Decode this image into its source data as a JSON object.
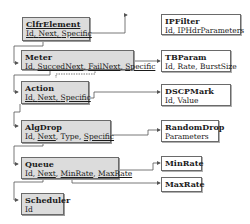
{
  "diagram": {
    "elements": [
      {
        "id": "clfrelement",
        "title": "ClfrElement",
        "fields": [
          "Id",
          "Next",
          "Specific"
        ],
        "underlined": [
          "Id",
          "Next",
          "Specific"
        ],
        "title_underlined": true
      },
      {
        "id": "meter",
        "title": "Meter",
        "fields": [
          "Id",
          "SuccedNext",
          "FailNext",
          "Specific"
        ],
        "underlined": [
          "SuccedNext",
          "FailNext",
          "Specific"
        ]
      },
      {
        "id": "action",
        "title": "Action",
        "fields": [
          "Id",
          "Next",
          "Specific"
        ],
        "underlined": [
          "Id",
          "Next",
          "Specific"
        ]
      },
      {
        "id": "algdrop",
        "title": "AlgDrop",
        "fields": [
          "Id",
          "Next",
          "Type",
          "Specific"
        ],
        "underlined": [
          "Next",
          "Specific"
        ]
      },
      {
        "id": "queue",
        "title": "Queue",
        "fields": [
          "Id",
          "Next",
          "MinRate",
          "MaxRate"
        ],
        "underlined": [
          "Next",
          "MinRate",
          "MaxRate"
        ]
      },
      {
        "id": "scheduler",
        "title": "Scheduler",
        "fields": [
          "Id"
        ],
        "underlined": []
      }
    ],
    "parameters": [
      {
        "id": "ipfilter",
        "title": "IPFilter",
        "fields_text": "Id, IPHdrParameters"
      },
      {
        "id": "tbparam",
        "title": "TBParam",
        "fields_text": "Id, Rate, BurstSize"
      },
      {
        "id": "dscpmark",
        "title": "DSCPMark",
        "fields_text": "Id, Value"
      },
      {
        "id": "randomdrop",
        "title": "RandomDrop",
        "fields_text": "Parameters"
      },
      {
        "id": "minrate",
        "title": "MinRate",
        "fields_text": ""
      },
      {
        "id": "maxrate",
        "title": "MaxRate",
        "fields_text": ""
      }
    ],
    "labels": {
      "clfr_title": "ClfrElement",
      "clfr_f1": "Id",
      "clfr_f2": "Next",
      "clfr_f3": "Specific",
      "meter_title": "Meter",
      "meter_f1": "Id",
      "meter_f2": "SuccedNext",
      "meter_f3": "FailNext",
      "meter_f4": "Specific",
      "action_title": "Action",
      "action_f1": "Id",
      "action_f2": "Next",
      "action_f3": "Specific",
      "algdrop_title": "AlgDrop",
      "algdrop_f1": "Id",
      "algdrop_f2": "Next",
      "algdrop_f3": "Type",
      "algdrop_f4": "Specific",
      "queue_title": "Queue",
      "queue_f1": "Id",
      "queue_f2": "Next",
      "queue_f3": "MinRate",
      "queue_f4": "MaxRate",
      "scheduler_title": "Scheduler",
      "scheduler_f1": "Id",
      "ipfilter_title": "IPFilter",
      "ipfilter_fields": "Id, IPHdrParameters",
      "tbparam_title": "TBParam",
      "tbparam_fields": "Id, Rate, BurstSize",
      "dscpmark_title": "DSCPMark",
      "dscpmark_fields": "Id, Value",
      "randomdrop_title": "RandomDrop",
      "randomdrop_fields": "Parameters",
      "minrate_title": "MinRate",
      "maxrate_title": "MaxRate",
      "sep": ", "
    },
    "colors": {
      "box_fill": "#dcdcdc",
      "param_fill": "#ffffff",
      "line": "#555555"
    }
  }
}
